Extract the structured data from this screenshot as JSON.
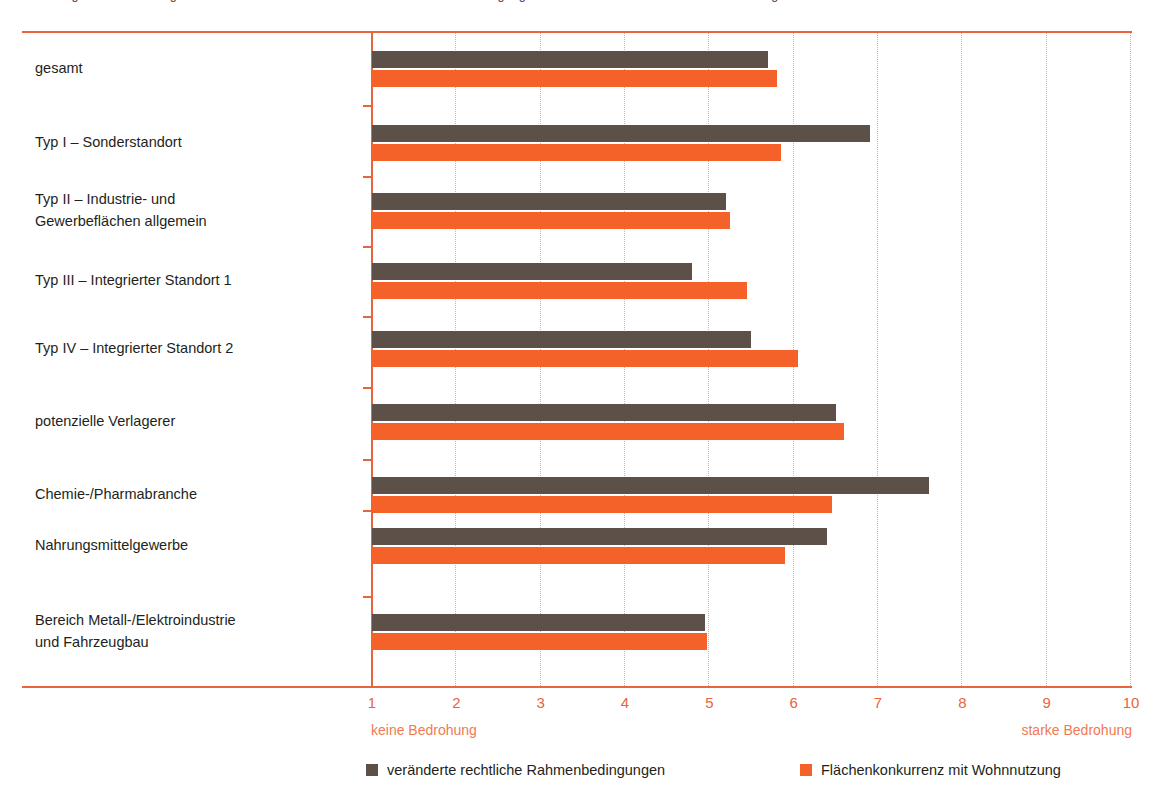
{
  "caption": {
    "clipped_top_line": "Abbildung 4-12: Bedrohung der Standorte durch veränderte rechtliche Rahmenbedingungen und Flächenkonkurrenz mit Wohnnutzung"
  },
  "colors": {
    "accent": "#e8643c",
    "bar_dark": "#5c5048",
    "bar_orange": "#f4622a",
    "grid": "#f0a98f",
    "text": "#231f20"
  },
  "axis": {
    "note_left": "keine Bedrohung",
    "note_right": "starke Bedrohung",
    "ticks": [
      "1",
      "2",
      "3",
      "4",
      "5",
      "6",
      "7",
      "8",
      "9",
      "10"
    ]
  },
  "legend": {
    "items": [
      {
        "label": "veränderte rechtliche Rahmenbedingungen",
        "color": "#5c5048"
      },
      {
        "label": "Flächenkonkurrenz mit Wohnnutzung",
        "color": "#f4622a"
      }
    ]
  },
  "chart_data": {
    "type": "bar",
    "orientation": "horizontal",
    "title": "",
    "xlabel": "",
    "ylabel": "",
    "xlim": [
      1,
      10
    ],
    "grid": true,
    "legend_position": "bottom",
    "categories": [
      "gesamt",
      "Typ I – Sonderstandort",
      "Typ II – Industrie- und Gewerbeflächen allgemein",
      "Typ III – Integrierter Standort 1",
      "Typ IV – Integrierter Standort 2",
      "potenzielle Verlagerer",
      "Chemie-/Pharmabranche",
      "Nahrungsmittelgewerbe",
      "Bereich Metall-/Elektroindustrie und Fahrzeugbau"
    ],
    "category_lines": [
      [
        "gesamt"
      ],
      [
        "Typ I – Sonderstandort"
      ],
      [
        "Typ II – Industrie- und",
        "Gewerbeflächen allgemein"
      ],
      [
        "Typ III – Integrierter Standort 1"
      ],
      [
        "Typ IV – Integrierter Standort 2"
      ],
      [
        "potenzielle Verlagerer"
      ],
      [
        "Chemie-/Pharmabranche"
      ],
      [
        "Nahrungsmittelgewerbe"
      ],
      [
        "Bereich Metall-/Elektroindustrie",
        "und Fahrzeugbau"
      ]
    ],
    "series": [
      {
        "name": "veränderte rechtliche Rahmenbedingungen",
        "color": "#5c5048",
        "values": [
          5.7,
          6.9,
          5.2,
          4.8,
          5.5,
          6.5,
          7.6,
          6.4,
          4.95
        ]
      },
      {
        "name": "Flächenkonkurrenz mit Wohnnutzung",
        "color": "#f4622a",
        "values": [
          5.8,
          5.85,
          5.25,
          5.45,
          6.05,
          6.6,
          6.45,
          5.9,
          4.97
        ]
      }
    ]
  }
}
